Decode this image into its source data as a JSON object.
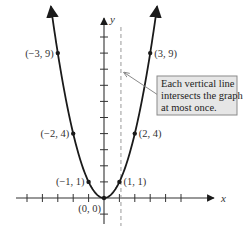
{
  "chart_data": {
    "type": "line",
    "title": "",
    "function": "y = x^2",
    "xlabel": "x",
    "ylabel": "y",
    "xlim": [
      -5.8,
      6.2
    ],
    "ylim": [
      -1.7,
      11
    ],
    "x_ticks": [
      -5,
      -4,
      -3,
      -2,
      -1,
      1,
      2,
      3,
      4,
      5
    ],
    "y_ticks": [
      -1,
      1,
      2,
      3,
      4,
      5,
      6,
      7,
      8,
      9,
      10
    ],
    "grid": false,
    "curve_domain": [
      -3.45,
      3.45
    ],
    "points": [
      {
        "x": -3,
        "y": 9,
        "label": "(−3, 9)",
        "label_side": "left"
      },
      {
        "x": 3,
        "y": 9,
        "label": "(3, 9)",
        "label_side": "right"
      },
      {
        "x": -2,
        "y": 4,
        "label": "(−2, 4)",
        "label_side": "left"
      },
      {
        "x": 2,
        "y": 4,
        "label": "(2, 4)",
        "label_side": "right"
      },
      {
        "x": -1,
        "y": 1,
        "label": "(−1, 1)",
        "label_side": "left"
      },
      {
        "x": 1,
        "y": 1,
        "label": "(1, 1)",
        "label_side": "right"
      },
      {
        "x": 0,
        "y": 0,
        "label": "(0, 0)",
        "label_side": "below-left"
      }
    ],
    "vertical_line": {
      "x": 1.1,
      "style": "dashed"
    },
    "annotation": {
      "lines": [
        "Each vertical line",
        "intersects the graph",
        "at most once."
      ],
      "arrow_target": {
        "x": 1.1,
        "y": 7.8
      }
    },
    "colors": {
      "curve": "#1a1a1a",
      "axis": "#333333",
      "dashed_line": "#9a9a9a",
      "note_fill": "#e6e6e6",
      "note_border": "#8a8a8a",
      "arrow": "#8a8a8a"
    }
  }
}
